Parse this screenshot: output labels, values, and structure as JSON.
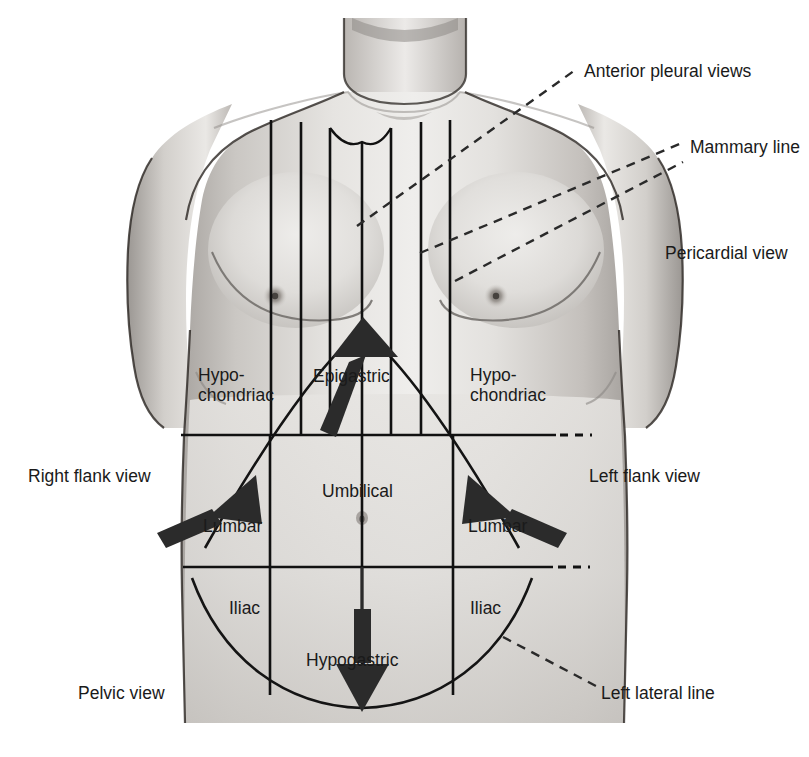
{
  "colors": {
    "line": "#111111",
    "text": "#1a1a1a",
    "arrow": "#2b2b2b",
    "skin_light": "#e9e7e4",
    "skin_mid": "#cfccc8",
    "skin_shadow": "#a9a5a1",
    "background": "#ffffff"
  },
  "outside_labels": [
    {
      "key": "anterior_pleural_views",
      "text": "Anterior pleural views",
      "x": 584,
      "y": 61,
      "align": "left"
    },
    {
      "key": "mammary_line",
      "text": "Mammary line",
      "x": 690,
      "y": 137,
      "align": "left"
    },
    {
      "key": "pericardial_view",
      "text": "Pericardial view",
      "x": 665,
      "y": 243,
      "align": "left"
    },
    {
      "key": "right_flank_view",
      "text": "Right flank view",
      "x": 28,
      "y": 466,
      "align": "left"
    },
    {
      "key": "left_flank_view",
      "text": "Left flank view",
      "x": 589,
      "y": 466,
      "align": "left"
    },
    {
      "key": "pelvic_view",
      "text": "Pelvic view",
      "x": 78,
      "y": 683,
      "align": "left"
    },
    {
      "key": "left_lateral_line",
      "text": "Left lateral line",
      "x": 601,
      "y": 683,
      "align": "left"
    }
  ],
  "region_labels": [
    {
      "key": "hypochondriac_right",
      "text": "Hypo-\nchondriac",
      "x": 198,
      "y": 366
    },
    {
      "key": "epigastric",
      "text": "Epigastric",
      "x": 313,
      "y": 366
    },
    {
      "key": "hypochondriac_left",
      "text": "Hypo-\nchondriac",
      "x": 470,
      "y": 366
    },
    {
      "key": "umbilical",
      "text": "Umbilical",
      "x": 322,
      "y": 481
    },
    {
      "key": "lumbar_right",
      "text": "Lumbar",
      "x": 203,
      "y": 516
    },
    {
      "key": "lumbar_left",
      "text": "Lumbar",
      "x": 468,
      "y": 516
    },
    {
      "key": "iliac_right",
      "text": "Iliac",
      "x": 229,
      "y": 598
    },
    {
      "key": "iliac_left",
      "text": "Iliac",
      "x": 470,
      "y": 598
    },
    {
      "key": "hypogastric",
      "text": "Hypogastric",
      "x": 306,
      "y": 650
    }
  ],
  "leader_lines": [
    {
      "key": "anterior-pleural-leader",
      "x1": 357,
      "y1": 226,
      "x2": 578,
      "y2": 68
    },
    {
      "key": "mammary-leader",
      "x1": 420,
      "y1": 253,
      "x2": 682,
      "y2": 143
    },
    {
      "key": "pericardial-leader",
      "x1": 455,
      "y1": 281,
      "x2": 683,
      "y2": 162
    },
    {
      "key": "left-lateral-leader",
      "x1": 503,
      "y1": 637,
      "x2": 596,
      "y2": 686
    }
  ],
  "vertical_lines_chest": [
    271,
    301,
    330,
    362,
    391,
    421,
    450
  ],
  "vertical_lines_abdomen": [
    270,
    362,
    453
  ],
  "horizontal_lines": [
    {
      "key": "subcostal-line",
      "y": 435,
      "x1": 181,
      "x2": 556
    },
    {
      "key": "intertubercular-line",
      "y": 567,
      "x1": 183,
      "x2": 553
    }
  ],
  "dash_ticks_right": [
    {
      "key": "subcostal-dash",
      "y": 435,
      "x": 562
    },
    {
      "key": "intertubercular-dash",
      "y": 567,
      "x": 560
    }
  ],
  "arrows": [
    {
      "key": "epigastric-probe-arrow",
      "direction": "up"
    },
    {
      "key": "right-flank-probe-arrow",
      "direction": "up-right"
    },
    {
      "key": "left-flank-probe-arrow",
      "direction": "up-left"
    },
    {
      "key": "pelvic-probe-arrow",
      "direction": "down"
    }
  ]
}
